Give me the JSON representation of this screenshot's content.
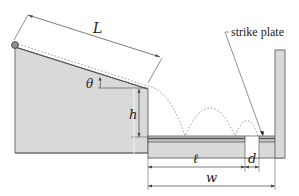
{
  "figure": {
    "type": "physics-diagram",
    "colors": {
      "block_fill": "#d9d9d9",
      "block_stroke": "#6e6e6e",
      "rail_dark": "#555555",
      "rail_light": "#c8c8c8",
      "dim_line": "#444444",
      "trajectory": "#8a8a8a",
      "ball": "#8c8c8c"
    }
  },
  "labels": {
    "L": "L",
    "theta": "θ",
    "h": "h",
    "ell": "ℓ",
    "d": "d",
    "w": "w",
    "strike_plate": "strike plate"
  }
}
